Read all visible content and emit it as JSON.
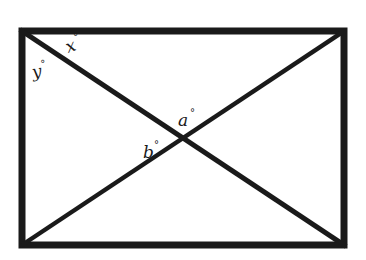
{
  "diagram": {
    "type": "rectangle-with-diagonals",
    "colors": {
      "stroke": "#1a1a1a",
      "background": "#ffffff"
    },
    "rectangle": {
      "x1": 22,
      "y1": 31,
      "x2": 344,
      "y2": 245
    },
    "intersection": {
      "x": 183,
      "y": 138
    },
    "labels": {
      "x": {
        "text": "x",
        "degree": "°"
      },
      "y": {
        "text": "y",
        "degree": "°"
      },
      "a": {
        "text": "a",
        "degree": "°"
      },
      "b": {
        "text": "b",
        "degree": "°"
      }
    }
  }
}
